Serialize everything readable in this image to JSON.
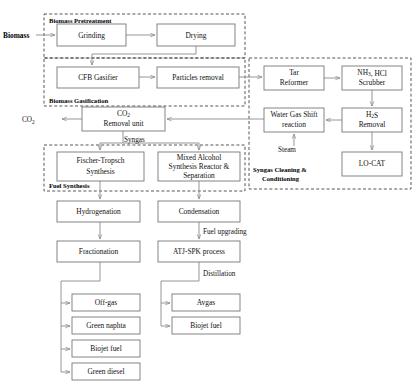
{
  "diagram": {
    "feed_label": "Biomass",
    "groups": [
      {
        "id": "pretreatment",
        "label": "Biomass Pretreatment",
        "x": 44,
        "y": 14,
        "w": 201,
        "h": 44,
        "label_x": 49,
        "label_y": 22
      },
      {
        "id": "gasification",
        "label": "Biomass Gasification",
        "x": 44,
        "y": 58,
        "w": 201,
        "h": 48,
        "label_x": 49,
        "label_y": 101
      },
      {
        "id": "syngas_cleaning",
        "label": "Syngas Cleaning &",
        "label2": "Conditioning",
        "x": 249,
        "y": 58,
        "w": 162,
        "h": 131,
        "label_x": 253,
        "label_y": 170
      },
      {
        "id": "fuel_synthesis",
        "label": "Fuel Synthesis",
        "x": 44,
        "y": 145,
        "w": 201,
        "h": 46,
        "label_x": 49,
        "label_y": 186
      }
    ],
    "boxes": [
      {
        "id": "grinding",
        "label": "Grinding",
        "x": 57,
        "y": 24,
        "w": 69,
        "h": 22
      },
      {
        "id": "drying",
        "label": "Drying",
        "x": 157,
        "y": 24,
        "w": 78,
        "h": 22
      },
      {
        "id": "cfb_gasifier",
        "label": "CFB Gasifier",
        "x": 57,
        "y": 67,
        "w": 82,
        "h": 21
      },
      {
        "id": "particles_removal",
        "label": "Particles removal",
        "x": 157,
        "y": 67,
        "w": 82,
        "h": 21
      },
      {
        "id": "tar_reformer",
        "label": "Tar",
        "label2": "Reformer",
        "x": 264,
        "y": 66,
        "w": 60,
        "h": 24
      },
      {
        "id": "nh3_hcl_scrubber",
        "label": "NH3, HCl",
        "label2": "Scrubber",
        "x": 342,
        "y": 66,
        "w": 60,
        "h": 24
      },
      {
        "id": "water_gas_shift",
        "label": "Water Gas Shift",
        "label2": "reaction",
        "x": 264,
        "y": 108,
        "w": 60,
        "h": 24
      },
      {
        "id": "h2s_removal",
        "label": "H2S",
        "label2": "Removal",
        "x": 342,
        "y": 108,
        "w": 60,
        "h": 24
      },
      {
        "id": "lo_cat",
        "label": "LO-CAT",
        "x": 342,
        "y": 152,
        "w": 60,
        "h": 24
      },
      {
        "id": "co2_removal",
        "label": "CO2",
        "label2": "Removal unit",
        "x": 82,
        "y": 107,
        "w": 83,
        "h": 24
      },
      {
        "id": "fischer_tropsch",
        "label": "Fischer-Tropsch",
        "label2": "Synthesis",
        "x": 57,
        "y": 152,
        "w": 87,
        "h": 29
      },
      {
        "id": "mixed_alcohol",
        "label": "Mixed Alcohol",
        "label2": "Synthesis Reactor &",
        "label3": "Separation",
        "x": 158,
        "y": 152,
        "w": 82,
        "h": 29
      },
      {
        "id": "hydrogenation",
        "label": "Hydrogenation",
        "x": 57,
        "y": 201,
        "w": 83,
        "h": 21
      },
      {
        "id": "condensation",
        "label": "Condensation",
        "x": 158,
        "y": 201,
        "w": 82,
        "h": 21
      },
      {
        "id": "fractionation",
        "label": "Fractionation",
        "x": 57,
        "y": 241,
        "w": 83,
        "h": 21
      },
      {
        "id": "atj_spk",
        "label": "ATJ-SPK process",
        "x": 158,
        "y": 241,
        "w": 82,
        "h": 21
      },
      {
        "id": "off_gas",
        "label": "Off-gas",
        "x": 72,
        "y": 294,
        "w": 68,
        "h": 17
      },
      {
        "id": "green_naphta",
        "label": "Green naphta",
        "x": 72,
        "y": 317,
        "w": 68,
        "h": 17
      },
      {
        "id": "biojet_fuel_left",
        "label": "Biojet fuel",
        "x": 72,
        "y": 340,
        "w": 68,
        "h": 17
      },
      {
        "id": "green_diesel",
        "label": "Green diesel",
        "x": 72,
        "y": 363,
        "w": 68,
        "h": 17
      },
      {
        "id": "avgas",
        "label": "Avgas",
        "x": 172,
        "y": 294,
        "w": 68,
        "h": 17
      },
      {
        "id": "biojet_fuel_right",
        "label": "Biojet fuel",
        "x": 172,
        "y": 317,
        "w": 68,
        "h": 17
      }
    ],
    "stream_labels": [
      {
        "id": "biomass-feed",
        "text": "Biomass",
        "x": 3,
        "y": 38,
        "bold": true
      },
      {
        "id": "co2-output",
        "text": "CO2",
        "x": 22,
        "y": 122,
        "bold": false
      },
      {
        "id": "syngas",
        "text": "Syngas",
        "x": 124,
        "y": 140,
        "bold": false
      },
      {
        "id": "steam",
        "text": "Steam",
        "x": 276,
        "y": 150,
        "bold": false
      },
      {
        "id": "fuel-upgrading",
        "text": "Fuel upgrading",
        "x": 187,
        "y": 232,
        "bold": false
      },
      {
        "id": "distillation",
        "text": "Distillation",
        "x": 195,
        "y": 274,
        "bold": false
      }
    ]
  }
}
